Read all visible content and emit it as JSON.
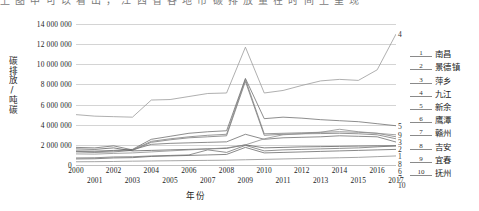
{
  "page_bleed_text": "上 图 中 可 以 看 出 ， 江 西 省 各 地 市 碳 排 放 量 在 时 间 上 呈 现",
  "axes": {
    "ylabel": "碳排放/吨碳",
    "xlabel": "年份",
    "yticks": [
      "14 000 000",
      "12 000 000",
      "10 000 000",
      "8 000 000",
      "6 000 000",
      "4 000 000",
      "2 000 000",
      "0"
    ],
    "xticks_top": [
      "2000",
      "2002",
      "2004",
      "2006",
      "2008",
      "2010",
      "2012",
      "2014",
      "2016"
    ],
    "xticks_bottom": [
      "2001",
      "2003",
      "2005",
      "2007",
      "2009",
      "2011",
      "2013",
      "2015",
      "2017"
    ]
  },
  "legend": {
    "items": [
      {
        "num": "1",
        "label": "南昌"
      },
      {
        "num": "2",
        "label": "景德镇"
      },
      {
        "num": "3",
        "label": "萍乡"
      },
      {
        "num": "4",
        "label": "九江"
      },
      {
        "num": "5",
        "label": "新余"
      },
      {
        "num": "6",
        "label": "鹰潭"
      },
      {
        "num": "7",
        "label": "赣州"
      },
      {
        "num": "8",
        "label": "吉安"
      },
      {
        "num": "9",
        "label": "宜春"
      },
      {
        "num": "10",
        "label": "抚州"
      }
    ]
  },
  "chart_data": {
    "type": "line",
    "title": "",
    "xlabel": "年份",
    "ylabel": "碳排放/吨碳",
    "xlim": [
      2000,
      2017
    ],
    "ylim": [
      0,
      14000000
    ],
    "ytick_step": 2000000,
    "grid": true,
    "legend_position": "right",
    "x": [
      2000,
      2001,
      2002,
      2003,
      2004,
      2005,
      2006,
      2007,
      2008,
      2009,
      2010,
      2011,
      2012,
      2013,
      2014,
      2015,
      2016,
      2017
    ],
    "series": [
      {
        "name": "南昌",
        "num": "1",
        "color": "#6f6f6f",
        "values": [
          1750000,
          1700000,
          1900000,
          1500000,
          2050000,
          2150000,
          2200000,
          2250000,
          2300000,
          3050000,
          2550000,
          2700000,
          2750000,
          2800000,
          2900000,
          2850000,
          2800000,
          2280000
        ]
      },
      {
        "name": "景德镇",
        "num": "2",
        "color": "#7a7a7a",
        "values": [
          1300000,
          1250000,
          1300000,
          1450000,
          2250000,
          2500000,
          2700000,
          2800000,
          2900000,
          8300000,
          2950000,
          3050000,
          3100000,
          3120000,
          3150000,
          3100000,
          3000000,
          2600000
        ]
      },
      {
        "name": "萍乡",
        "num": "3",
        "color": "#808080",
        "values": [
          1350000,
          1300000,
          1400000,
          1500000,
          2350000,
          2600000,
          2800000,
          2950000,
          3050000,
          8500000,
          3100000,
          3150000,
          3200000,
          3250000,
          3300000,
          3250000,
          3150000,
          2800000
        ]
      },
      {
        "name": "九江",
        "num": "4",
        "color": "#9a9a9a",
        "values": [
          5000000,
          4850000,
          4800000,
          4750000,
          6450000,
          6500000,
          6800000,
          7100000,
          7150000,
          11700000,
          7150000,
          7400000,
          7900000,
          8350000,
          8500000,
          8400000,
          9450000,
          13000000
        ]
      },
      {
        "name": "新余",
        "num": "5",
        "color": "#707070",
        "values": [
          1400000,
          1380000,
          1450000,
          1550000,
          2550000,
          2850000,
          3150000,
          3300000,
          3400000,
          8600000,
          4600000,
          4750000,
          4650000,
          4500000,
          4400000,
          4300000,
          4100000,
          3900000
        ]
      },
      {
        "name": "鹰潭",
        "num": "6",
        "color": "#757575",
        "values": [
          700000,
          720000,
          800000,
          820000,
          900000,
          950000,
          1000000,
          1500000,
          1250000,
          1950000,
          1400000,
          1500000,
          1550000,
          1600000,
          1650000,
          1700000,
          1800000,
          1900000
        ]
      },
      {
        "name": "赣州",
        "num": "7",
        "color": "#6a6a6a",
        "values": [
          600000,
          620000,
          700000,
          730000,
          850000,
          900000,
          950000,
          1000000,
          1050000,
          1750000,
          1200000,
          1250000,
          1300000,
          1350000,
          1400000,
          1450000,
          1500000,
          1550000
        ]
      },
      {
        "name": "吉安",
        "num": "8",
        "color": "#5f5f5f",
        "values": [
          1600000,
          1550000,
          1700000,
          1400000,
          1450000,
          1500000,
          1550000,
          1600000,
          1650000,
          2000000,
          1700000,
          1750000,
          1800000,
          1820000,
          1850000,
          1880000,
          1900000,
          1900000
        ]
      },
      {
        "name": "宜春",
        "num": "9",
        "color": "#8d8d8d",
        "values": [
          1100000,
          1080000,
          1150000,
          1200000,
          1300000,
          1400000,
          1500000,
          1600000,
          1700000,
          2000000,
          2600000,
          3000000,
          3100000,
          3250000,
          3550000,
          3300000,
          3150000,
          3000000
        ]
      },
      {
        "name": "抚州",
        "num": "10",
        "color": "#8f8f8f",
        "values": [
          320000,
          330000,
          350000,
          380000,
          400000,
          420000,
          440000,
          460000,
          480000,
          520000,
          560000,
          600000,
          640000,
          680000,
          720000,
          760000,
          830000,
          900000
        ]
      }
    ],
    "end_labels": [
      {
        "num": "4",
        "y": 13000000
      },
      {
        "num": "5",
        "y": 3900000
      },
      {
        "num": "9",
        "y": 3000000
      },
      {
        "num": "3",
        "y": 2800000
      },
      {
        "num": "2",
        "y": 2600000
      },
      {
        "num": "1",
        "y": 2280000
      },
      {
        "num": "8",
        "y": 1900000
      },
      {
        "num": "6",
        "y": 1900000
      },
      {
        "num": "7",
        "y": 1550000
      },
      {
        "num": "10",
        "y": 900000
      }
    ]
  }
}
